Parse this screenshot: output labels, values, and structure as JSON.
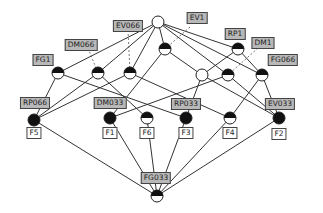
{
  "diagram": {
    "type": "concept-lattice",
    "colors": {
      "edge": "#333333",
      "dashed": "#555555",
      "attr_label_bg": "#b8b8b8",
      "obj_label_bg": "#ffffff",
      "node_dark": "#111111",
      "node_light": "#ffffff"
    },
    "nodes": [
      {
        "id": "top",
        "x": 158,
        "y": 22,
        "fill": "empty"
      },
      {
        "id": "n1",
        "x": 58,
        "y": 73,
        "fill": "half"
      },
      {
        "id": "n2",
        "x": 98,
        "y": 73,
        "fill": "half"
      },
      {
        "id": "n3",
        "x": 130,
        "y": 73,
        "fill": "half"
      },
      {
        "id": "n4",
        "x": 165,
        "y": 49,
        "fill": "half"
      },
      {
        "id": "n5",
        "x": 238,
        "y": 49,
        "fill": "half"
      },
      {
        "id": "n6",
        "x": 202,
        "y": 75,
        "fill": "empty"
      },
      {
        "id": "n7",
        "x": 228,
        "y": 75,
        "fill": "half"
      },
      {
        "id": "n8",
        "x": 262,
        "y": 75,
        "fill": "half"
      },
      {
        "id": "f5",
        "x": 34,
        "y": 120,
        "fill": "full"
      },
      {
        "id": "f1",
        "x": 110,
        "y": 118,
        "fill": "full"
      },
      {
        "id": "f6",
        "x": 147,
        "y": 118,
        "fill": "half"
      },
      {
        "id": "f3",
        "x": 186,
        "y": 118,
        "fill": "full"
      },
      {
        "id": "f4",
        "x": 230,
        "y": 118,
        "fill": "half"
      },
      {
        "id": "f2",
        "x": 279,
        "y": 118,
        "fill": "full"
      },
      {
        "id": "bottom",
        "x": 157,
        "y": 196,
        "fill": "half"
      }
    ],
    "edges": [
      [
        "top",
        "n1"
      ],
      [
        "top",
        "n2"
      ],
      [
        "top",
        "n3"
      ],
      [
        "top",
        "n4"
      ],
      [
        "top",
        "n5"
      ],
      [
        "top",
        "n7"
      ],
      [
        "top",
        "n8"
      ],
      [
        "n1",
        "f5"
      ],
      [
        "n1",
        "f3"
      ],
      [
        "n2",
        "f5"
      ],
      [
        "n2",
        "f6"
      ],
      [
        "n3",
        "f5"
      ],
      [
        "n3",
        "f4"
      ],
      [
        "n4",
        "f1"
      ],
      [
        "n4",
        "n6"
      ],
      [
        "n5",
        "n6"
      ],
      [
        "n5",
        "n8"
      ],
      [
        "n6",
        "f3"
      ],
      [
        "n6",
        "f2"
      ],
      [
        "n7",
        "f1"
      ],
      [
        "n7",
        "f2"
      ],
      [
        "n8",
        "f4"
      ],
      [
        "n8",
        "f2"
      ],
      [
        "f5",
        "bottom"
      ],
      [
        "f1",
        "bottom"
      ],
      [
        "f6",
        "bottom"
      ],
      [
        "f3",
        "bottom"
      ],
      [
        "f4",
        "bottom"
      ],
      [
        "f2",
        "bottom"
      ]
    ],
    "dashed_edges": [
      {
        "from": [
          128,
          30
        ],
        "to": [
          130,
          73
        ]
      },
      {
        "from": [
          88,
          48
        ],
        "to": [
          98,
          73
        ]
      },
      {
        "from": [
          190,
          27
        ],
        "to": [
          165,
          49
        ]
      },
      {
        "from": [
          258,
          48
        ],
        "to": [
          228,
          75
        ]
      }
    ],
    "attribute_labels": [
      {
        "text": "EV066",
        "x": 128,
        "y": 26
      },
      {
        "text": "EV1",
        "x": 197,
        "y": 18
      },
      {
        "text": "DM066",
        "x": 81,
        "y": 45
      },
      {
        "text": "RP1",
        "x": 235,
        "y": 34
      },
      {
        "text": "DM1",
        "x": 263,
        "y": 43
      },
      {
        "text": "FG1",
        "x": 43,
        "y": 60
      },
      {
        "text": "FG066",
        "x": 283,
        "y": 60
      },
      {
        "text": "RP066",
        "x": 35,
        "y": 103
      },
      {
        "text": "DM033",
        "x": 110,
        "y": 103
      },
      {
        "text": "RP033",
        "x": 186,
        "y": 104
      },
      {
        "text": "EV033",
        "x": 280,
        "y": 104
      },
      {
        "text": "FG033",
        "x": 156,
        "y": 178
      }
    ],
    "object_labels": [
      {
        "text": "F5",
        "x": 34,
        "y": 133
      },
      {
        "text": "F1",
        "x": 110,
        "y": 133
      },
      {
        "text": "F6",
        "x": 147,
        "y": 133
      },
      {
        "text": "F3",
        "x": 186,
        "y": 133
      },
      {
        "text": "F4",
        "x": 230,
        "y": 133
      },
      {
        "text": "F2",
        "x": 279,
        "y": 134
      }
    ]
  }
}
